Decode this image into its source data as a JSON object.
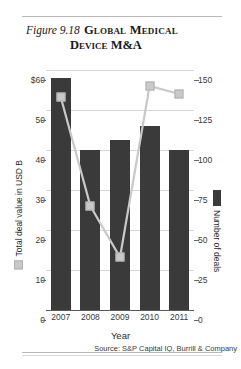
{
  "figure": {
    "label": "Figure 9.18",
    "title_line1": "Global Medical",
    "title_line2": "Device M&A"
  },
  "source_note": "Source: S&P Capital IQ, Burrill & Company",
  "legend": {
    "left_axis_title": "Total deal value in USD B",
    "right_axis_title": "Number of deals",
    "bar_color": "#3a3a3a",
    "line_color": "#c9c9c9"
  },
  "chart_data": {
    "type": "bar",
    "title": "Figure 9.18 Global Medical Device M&A",
    "xlabel": "Year",
    "ylabel": "Total deal value in USD B",
    "y2label": "Number of deals",
    "categories": [
      "2007",
      "2008",
      "2009",
      "2010",
      "2011"
    ],
    "series": [
      {
        "name": "Total deal value in USD B",
        "type": "bar",
        "axis": "left",
        "color": "#3a3a3a",
        "values": [
          58,
          40,
          42.5,
          46,
          40
        ]
      },
      {
        "name": "Number of deals",
        "type": "line",
        "axis": "right",
        "color": "#c9c9c9",
        "values": [
          133,
          65,
          33,
          140,
          135
        ]
      }
    ],
    "ylim": [
      0,
      60
    ],
    "y2lim": [
      0,
      150
    ],
    "yticks": [
      "$60",
      "50",
      "40",
      "30",
      "20",
      "10",
      "0"
    ],
    "ytick_values": [
      60,
      50,
      40,
      30,
      20,
      10,
      0
    ],
    "y2ticks": [
      "150",
      "125",
      "100",
      "75",
      "50",
      "25",
      "0"
    ],
    "y2tick_values": [
      150,
      125,
      100,
      75,
      50,
      25,
      0
    ],
    "grid": true,
    "legend_position": "axis-titles"
  }
}
